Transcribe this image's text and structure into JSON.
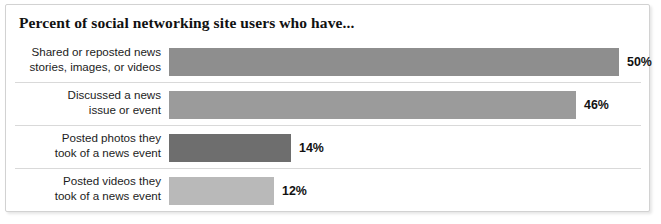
{
  "chart_data": {
    "type": "bar",
    "title": "Percent of social networking site users who have...",
    "orientation": "horizontal",
    "xlabel": "",
    "ylabel": "",
    "grid": false,
    "legend": "none",
    "axis_visible": false,
    "xlim": [
      0,
      100
    ],
    "unit": "%",
    "categories": [
      "Shared or reposted news stories, images, or videos",
      "Discussed a news issue or event",
      "Posted photos they took of a news event",
      "Posted videos they took of a news event"
    ],
    "values": [
      50,
      46,
      14,
      12
    ],
    "value_labels": [
      "50%",
      "46%",
      "14%",
      "12%"
    ],
    "bar_colors": [
      "#8e8e8e",
      "#9b9b9b",
      "#6e6e6e",
      "#b9b9b9"
    ]
  },
  "rows": [
    {
      "label_line1": "Shared or reposted news",
      "label_line2": "stories, images, or videos",
      "value_label": "50%",
      "value": 50,
      "color": "#8e8e8e",
      "bar_width_px": "450px",
      "value_left_px": "458px"
    },
    {
      "label_line1": "Discussed a news",
      "label_line2": "issue or event",
      "value_label": "46%",
      "value": 46,
      "color": "#9b9b9b",
      "bar_width_px": "407px",
      "value_left_px": "415px"
    },
    {
      "label_line1": "Posted photos they",
      "label_line2": "took of a news event",
      "value_label": "14%",
      "value": 14,
      "color": "#6e6e6e",
      "bar_width_px": "122px",
      "value_left_px": "130px"
    },
    {
      "label_line1": "Posted videos they",
      "label_line2": "took of a news event",
      "value_label": "12%",
      "value": 12,
      "color": "#b9b9b9",
      "bar_width_px": "105px",
      "value_left_px": "113px"
    }
  ]
}
